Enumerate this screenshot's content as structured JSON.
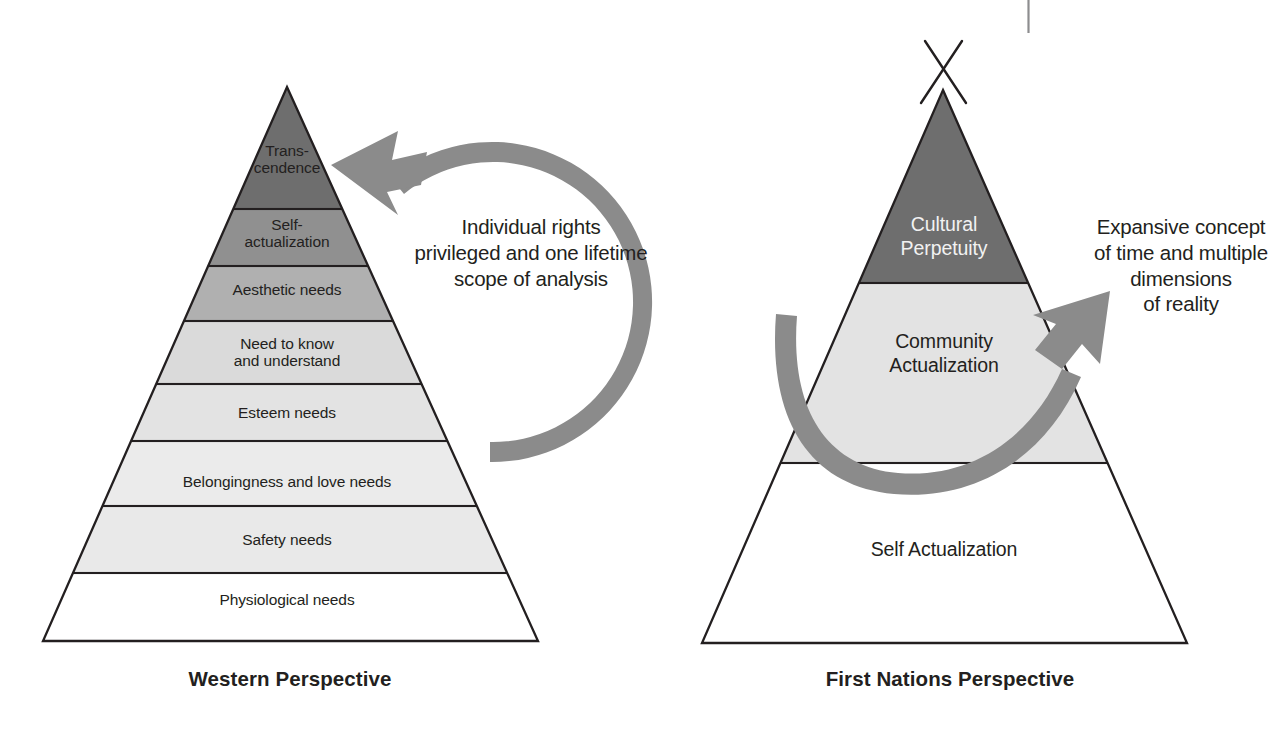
{
  "diagram": {
    "palette": {
      "outline": "#231f20",
      "arrow_gray": "#8b8b8b",
      "page_background": "#ffffff",
      "tier_darkest": "#6e6e6e",
      "tier_dark": "#8f8f8f",
      "tier_mid": "#b4b4b4",
      "tier_light": "#d9d9d9",
      "tier_lighter": "#e4e4e4",
      "tier_palest": "#efefef",
      "tier_white": "#ffffff"
    }
  },
  "left_pyramid": {
    "caption": "Western Perspective",
    "tier_count": 8,
    "tiers": [
      {
        "index": 0,
        "label": "Trans-\ncendence",
        "fill": "#6e6e6e",
        "font_size": 15.5
      },
      {
        "index": 1,
        "label": "Self-\nactualization",
        "fill": "#8f8f8f",
        "font_size": 15.5
      },
      {
        "index": 2,
        "label": "Aesthetic needs",
        "fill": "#b0b0b0",
        "font_size": 15.5
      },
      {
        "index": 3,
        "label": "Need to know\nand understand",
        "fill": "#d9d9d9",
        "font_size": 15.5
      },
      {
        "index": 4,
        "label": "Esteem needs",
        "fill": "#e2e2e2",
        "font_size": 15.5
      },
      {
        "index": 5,
        "label": "Belongingness and love needs",
        "fill": "#eaeaea",
        "font_size": 15.5
      },
      {
        "index": 6,
        "label": "Safety needs",
        "fill": "#e9e9e9",
        "font_size": 15.5
      },
      {
        "index": 7,
        "label": "Physiological needs",
        "fill": "#ffffff",
        "font_size": 15.5
      }
    ]
  },
  "right_pyramid": {
    "caption": "First Nations Perspective",
    "tier_count": 3,
    "has_teepee_poles": true,
    "tiers": [
      {
        "index": 0,
        "label": "Cultural\nPerpetuity",
        "fill": "#6e6e6e",
        "font_size": 19.5
      },
      {
        "index": 1,
        "label": "Community\nActualization",
        "fill": "#e2e2e2",
        "font_size": 19.5
      },
      {
        "index": 2,
        "label": "Self Actualization",
        "fill": "#ffffff",
        "font_size": 19.5
      }
    ]
  },
  "annotations": {
    "left": {
      "text": "Individual rights\nprivileged and one lifetime\nscope of analysis",
      "arrow_name": "circular-cycle-arrow-counterclockwise"
    },
    "right": {
      "text": "Expansive concept\nof time and multiple\ndimensions\nof reality",
      "arrow_name": "u-shaped-upward-arrow"
    }
  },
  "page_artifacts": {
    "top_right_rule": "vertical page rule",
    "bottom_caption_fragment": "                                                                            "
  }
}
